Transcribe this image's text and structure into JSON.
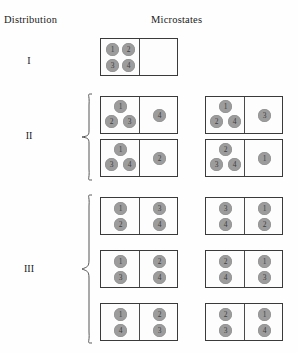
{
  "headers": {
    "distribution": "Distribution",
    "microstates": "Microstates"
  },
  "colors": {
    "token_fill": "#9c9c9c",
    "token_text": "#3d3d3d",
    "box_border": "#3a3a3a",
    "divider": "#4a4a4a",
    "background": "#fefefe",
    "brace": "#555555"
  },
  "distributions": [
    {
      "label": "I",
      "rows": [
        {
          "boxes": [
            {
              "left": [
                "1",
                "2",
                "3",
                "4"
              ],
              "right": []
            }
          ]
        }
      ]
    },
    {
      "label": "II",
      "rows": [
        {
          "boxes": [
            {
              "left": [
                "1",
                "2",
                "3"
              ],
              "right": [
                "4"
              ]
            },
            {
              "left": [
                "1",
                "2",
                "4"
              ],
              "right": [
                "3"
              ]
            }
          ]
        },
        {
          "boxes": [
            {
              "left": [
                "1",
                "3",
                "4"
              ],
              "right": [
                "2"
              ]
            },
            {
              "left": [
                "2",
                "3",
                "4"
              ],
              "right": [
                "1"
              ]
            }
          ]
        }
      ]
    },
    {
      "label": "III",
      "rows": [
        {
          "boxes": [
            {
              "left": [
                "1",
                "2"
              ],
              "right": [
                "3",
                "4"
              ]
            },
            {
              "left": [
                "3",
                "4"
              ],
              "right": [
                "1",
                "2"
              ]
            }
          ]
        },
        {
          "boxes": [
            {
              "left": [
                "1",
                "3"
              ],
              "right": [
                "2",
                "4"
              ]
            },
            {
              "left": [
                "2",
                "4"
              ],
              "right": [
                "1",
                "3"
              ]
            }
          ]
        },
        {
          "boxes": [
            {
              "left": [
                "1",
                "4"
              ],
              "right": [
                "2",
                "3"
              ]
            },
            {
              "left": [
                "2",
                "3"
              ],
              "right": [
                "1",
                "4"
              ]
            }
          ]
        }
      ]
    }
  ]
}
